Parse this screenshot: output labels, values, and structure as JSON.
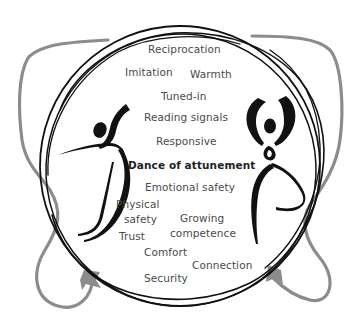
{
  "diagram": {
    "title": "Dance of attunement",
    "labels": [
      {
        "id": "reciprocation",
        "text": "Reciprocation"
      },
      {
        "id": "imitation",
        "text": "Imitation"
      },
      {
        "id": "warmth",
        "text": "Warmth"
      },
      {
        "id": "tuned-in",
        "text": "Tuned-in"
      },
      {
        "id": "reading-signals",
        "text": "Reading signals"
      },
      {
        "id": "responsive",
        "text": "Responsive"
      },
      {
        "id": "dance-of-attunement",
        "text": "Dance of attunement"
      },
      {
        "id": "emotional-safety",
        "text": "Emotional safety"
      },
      {
        "id": "physical-safety-line1",
        "text": "Physical"
      },
      {
        "id": "physical-safety-line2",
        "text": "safety"
      },
      {
        "id": "growing-competence-line1",
        "text": "Growing"
      },
      {
        "id": "growing-competence-line2",
        "text": "competence"
      },
      {
        "id": "trust",
        "text": "Trust"
      },
      {
        "id": "comfort",
        "text": "Comfort"
      },
      {
        "id": "connection",
        "text": "Connection"
      },
      {
        "id": "security",
        "text": "Security"
      }
    ],
    "figures": [
      {
        "id": "left-dancer",
        "description": "stylized dancer leaning left"
      },
      {
        "id": "right-dancer",
        "description": "stylized dancer with arms raised"
      }
    ],
    "colors": {
      "circle_stroke": "#111111",
      "loop_stroke": "#8a8a8a",
      "text": "#4a4a4a",
      "title_text": "#222222",
      "background": "#ffffff"
    }
  }
}
